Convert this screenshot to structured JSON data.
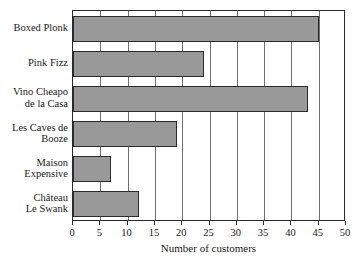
{
  "chart_data": {
    "type": "bar",
    "orientation": "horizontal",
    "title": "",
    "xlabel": "Number of customers",
    "ylabel": "",
    "categories": [
      "Boxed Plonk",
      "Pink Fizz",
      "Vino Cheapo\nde la Casa",
      "Les Caves de\nBooze",
      "Maison\nExpensive",
      "Château\nLe Swank"
    ],
    "values": [
      45,
      24,
      43,
      19,
      7,
      12
    ],
    "xlim": [
      0,
      50
    ],
    "xticks": [
      0,
      5,
      10,
      15,
      20,
      25,
      30,
      35,
      40,
      45,
      50
    ],
    "xtick_labels": [
      "0",
      "5",
      "10",
      "15",
      "20",
      "25",
      "30",
      "35",
      "40",
      "45",
      "50"
    ],
    "grid": "vertical",
    "legend": "none",
    "bar_color": "#999999",
    "bar_border_color": "#2b2b2b",
    "axis_color": "#2b2b2b",
    "gridline_color": "#6e6e6e",
    "text_color": "#1a1a1a",
    "background_color": "#ffffff"
  }
}
